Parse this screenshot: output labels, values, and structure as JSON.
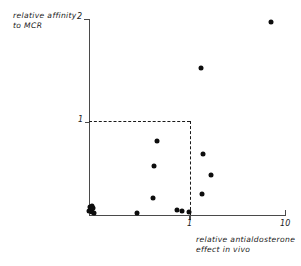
{
  "chart_data": {
    "type": "scatter",
    "title": "",
    "xlabel": "relative antialdosterone effect in vivo",
    "ylabel": "relative affinity to MCR",
    "xlabel_line1": "relative antialdosterone",
    "xlabel_line2": "effect  in vivo",
    "ylabel_line1": "relative affinity",
    "ylabel_line2": "to  MCR",
    "x_ticks": [
      "1",
      "10"
    ],
    "x_tick_values": [
      1,
      10
    ],
    "y_ticks": [
      "1",
      "2"
    ],
    "y_tick_values": [
      1,
      2
    ],
    "xlim": [
      0,
      10
    ],
    "ylim": [
      0,
      2
    ],
    "x_scale": "linear",
    "grid": false,
    "legend": "none",
    "annotations": [
      {
        "name": "reference-box",
        "type": "dashed-lines",
        "x": 1,
        "y": 1,
        "description": "dashed lines marking relative affinity = 1 and relative antialdosterone effect = 1"
      }
    ],
    "points": [
      {
        "x": 0.02,
        "y": 0.04
      },
      {
        "x": 0.05,
        "y": 0.08
      },
      {
        "x": 0.1,
        "y": 0.05
      },
      {
        "x": 0.14,
        "y": 0.09
      },
      {
        "x": 0.17,
        "y": 0.03
      },
      {
        "x": 0.22,
        "y": 0.07
      },
      {
        "x": 0.28,
        "y": 0.02
      },
      {
        "x": 2.45,
        "y": 0.02
      },
      {
        "x": 3.25,
        "y": 0.17
      },
      {
        "x": 3.3,
        "y": 0.5
      },
      {
        "x": 3.45,
        "y": 0.76
      },
      {
        "x": 4.5,
        "y": 0.05
      },
      {
        "x": 4.72,
        "y": 0.04
      },
      {
        "x": 5.1,
        "y": 0.03
      },
      {
        "x": 5.75,
        "y": 0.21
      },
      {
        "x": 5.8,
        "y": 0.62
      },
      {
        "x": 6.2,
        "y": 0.41
      },
      {
        "x": 5.72,
        "y": 1.5
      },
      {
        "x": 9.3,
        "y": 1.97
      }
    ]
  },
  "plot_geometry": {
    "origin_px": {
      "x": 89,
      "y": 215
    },
    "x_axis_end_px": 285,
    "y_axis_top_px": 19,
    "y_one_px": 121.5,
    "x_one_px": 190
  },
  "colors": {
    "point": "#0d0d0d",
    "axis": "#4a4a4a",
    "dashed": "#1a1a1a",
    "text": "#1a1a1a",
    "background": "#ffffff"
  }
}
